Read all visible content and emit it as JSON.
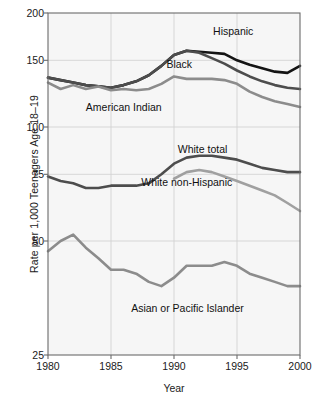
{
  "chart_data": {
    "type": "line",
    "title": "",
    "xlabel": "Year",
    "ylabel": "Rate per 1,000 Teenagers Age 18–19",
    "xlim": [
      1980,
      2000
    ],
    "ylim": [
      25,
      200
    ],
    "yscale": "log",
    "grid": true,
    "legend_position": "inline-annotations",
    "xticks": [
      "1980",
      "1985",
      "1990",
      "1995",
      "2000"
    ],
    "xtick_values": [
      1980,
      1985,
      1990,
      1995,
      2000
    ],
    "yticks": [
      "25",
      "50",
      "75",
      "100",
      "150",
      "200"
    ],
    "ytick_values": [
      25,
      50,
      75,
      100,
      150,
      200
    ],
    "x": [
      1980,
      1981,
      1982,
      1983,
      1984,
      1985,
      1986,
      1987,
      1988,
      1989,
      1990,
      1991,
      1992,
      1993,
      1994,
      1995,
      1996,
      1997,
      1998,
      1999,
      2000
    ],
    "series": [
      {
        "name": "Hispanic",
        "color": "#141414",
        "width": 2.6,
        "label_x": 1993.1,
        "label_y": 178,
        "values": [
          135,
          133,
          131,
          129,
          128,
          127,
          129,
          132,
          137,
          145,
          155,
          159,
          158,
          157,
          156,
          150,
          146,
          143,
          140,
          139,
          145
        ]
      },
      {
        "name": "Black",
        "color": "#4d4d4d",
        "width": 2.6,
        "label_x": 1989.4,
        "label_y": 146,
        "values": [
          135,
          133,
          131,
          129,
          128,
          127,
          129,
          132,
          137,
          145,
          155,
          159,
          157,
          152,
          147,
          141,
          136,
          132,
          129,
          127,
          126
        ]
      },
      {
        "name": "American Indian",
        "color": "#8c8c8c",
        "width": 2.6,
        "label_x": 1983.0,
        "label_y": 112,
        "values": [
          131,
          126,
          129,
          126,
          128,
          125,
          126,
          125,
          126,
          130,
          136,
          134,
          134,
          134,
          133,
          130,
          124,
          120,
          117,
          115,
          113
        ]
      },
      {
        "name": "White total",
        "color": "#4d4d4d",
        "width": 2.6,
        "label_x": 1990.3,
        "label_y": 87,
        "values": [
          74,
          72,
          71,
          69,
          69,
          70,
          70,
          70,
          71,
          75,
          80,
          83,
          84,
          84,
          83,
          82,
          80,
          78,
          77,
          76,
          76
        ]
      },
      {
        "name": "White non-Hispanic",
        "color": "#a0a0a0",
        "width": 2.6,
        "label_x": 1987.4,
        "label_y": 71,
        "values": [
          null,
          null,
          null,
          null,
          null,
          null,
          null,
          null,
          null,
          null,
          73,
          76,
          77,
          76,
          74,
          72,
          70,
          68,
          66,
          63,
          60
        ]
      },
      {
        "name": "Asian or Pacific Islander",
        "color": "#8c8c8c",
        "width": 2.6,
        "label_x": 1986.6,
        "label_y": 33,
        "values": [
          47,
          50,
          52,
          48,
          45,
          42,
          42,
          41,
          39,
          38,
          40,
          43,
          43,
          43,
          44,
          43,
          41,
          40,
          39,
          38,
          38
        ]
      }
    ]
  },
  "figure": {
    "plot_bg": "#f6f6f6",
    "frame_color": "#6b6b6b",
    "grid_color": "#d2d2d2"
  }
}
